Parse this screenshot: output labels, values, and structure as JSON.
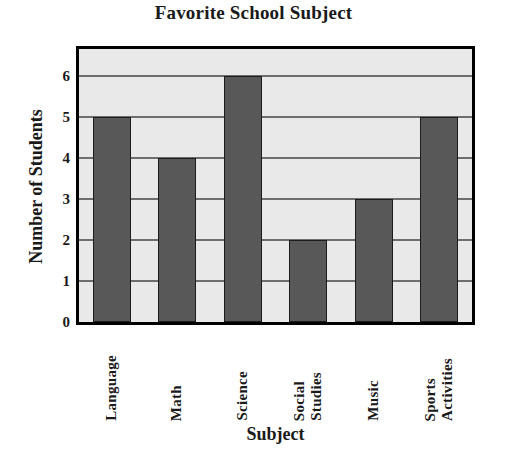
{
  "chart_data": {
    "type": "bar",
    "title": "Favorite School Subject",
    "xlabel": "Subject",
    "ylabel": "Number of Students",
    "categories": [
      "Language",
      "Math",
      "Science",
      "Social Studies",
      "Music",
      "Sports Activities"
    ],
    "category_lines": [
      [
        "Language"
      ],
      [
        "Math"
      ],
      [
        "Science"
      ],
      [
        "Social",
        "Studies"
      ],
      [
        "Music"
      ],
      [
        "Sports",
        "Activities"
      ]
    ],
    "values": [
      5,
      4,
      6,
      2,
      3,
      5
    ],
    "ylim": [
      0,
      6.67
    ],
    "yticks": [
      0,
      1,
      2,
      3,
      4,
      5,
      6
    ],
    "ytick_labels": [
      "0",
      "1",
      "2",
      "3",
      "4",
      "5",
      "6"
    ],
    "grid": true,
    "legend": "none",
    "colors": {
      "bar_fill": "#585858",
      "bar_edge": "#1c1c1c",
      "plot_background": "#e9e9e9",
      "gridline": "#6e6e6e",
      "frame": "#000000",
      "text": "#1a1a1a",
      "page_background": "#ffffff"
    }
  }
}
